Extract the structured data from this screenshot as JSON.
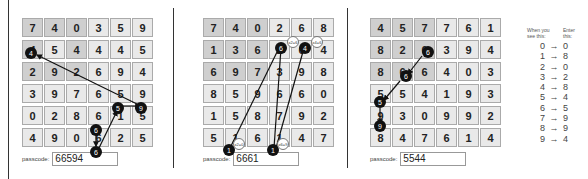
{
  "panels": [
    {
      "grid": [
        [
          "7",
          "4",
          "0",
          "3",
          "5",
          "9"
        ],
        [
          "4",
          "5",
          "4",
          "4",
          "4",
          "5"
        ],
        [
          "2",
          "9",
          "2",
          "6",
          "9",
          "4"
        ],
        [
          "3",
          "9",
          "7",
          "6",
          "5",
          "9"
        ],
        [
          "0",
          "2",
          "8",
          "6",
          "1",
          "5"
        ],
        [
          "4",
          "9",
          "0",
          "6",
          "2",
          "5"
        ]
      ],
      "path_labels": [
        "6",
        "6",
        "5",
        "9",
        "4"
      ],
      "passcode_label": "passcode:",
      "passcode_value": "66594"
    },
    {
      "grid": [
        [
          "7",
          "4",
          "0",
          "2",
          "6",
          "8"
        ],
        [
          "1",
          "3",
          "6",
          "2",
          "6",
          "4"
        ],
        [
          "6",
          "9",
          "7",
          "3",
          "9",
          "8"
        ],
        [
          "8",
          "5",
          "9",
          "6",
          "6",
          "0"
        ],
        [
          "1",
          "5",
          "8",
          "7",
          "9",
          "2"
        ],
        [
          "5",
          "1",
          "6",
          "1",
          "4",
          "7"
        ]
      ],
      "path_labels": [
        "1",
        "6",
        "1",
        "6",
        "4"
      ],
      "tags": [
        "x2=6",
        "x4=6",
        "x2=0",
        "x6=9"
      ],
      "passcode_label": "passcode:",
      "passcode_value": "6661"
    },
    {
      "grid": [
        [
          "4",
          "5",
          "7",
          "7",
          "6",
          "1"
        ],
        [
          "8",
          "2",
          "6",
          "3",
          "9",
          "4"
        ],
        [
          "8",
          "6",
          "6",
          "4",
          "0",
          "3"
        ],
        [
          "5",
          "5",
          "4",
          "1",
          "9",
          "3"
        ],
        [
          "9",
          "3",
          "0",
          "9",
          "9",
          "2"
        ],
        [
          "8",
          "4",
          "7",
          "6",
          "1",
          "4"
        ]
      ],
      "path_labels": [
        "6",
        "6",
        "5",
        "9"
      ],
      "passcode_label": "passcode:",
      "passcode_value": "5544"
    }
  ],
  "key": {
    "header_see": "When you see this:",
    "header_enter": "Enter this:",
    "rows": [
      {
        "see": "0",
        "enter": "0"
      },
      {
        "see": "1",
        "enter": "8"
      },
      {
        "see": "2",
        "enter": "0"
      },
      {
        "see": "3",
        "enter": "2"
      },
      {
        "see": "4",
        "enter": "8"
      },
      {
        "see": "5",
        "enter": "4"
      },
      {
        "see": "6",
        "enter": "5"
      },
      {
        "see": "7",
        "enter": "9"
      },
      {
        "see": "8",
        "enter": "9"
      },
      {
        "see": "9",
        "enter": "4"
      }
    ],
    "arrow_glyph": "→"
  }
}
